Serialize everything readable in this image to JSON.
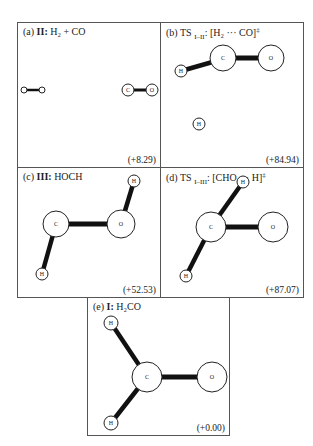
{
  "panels": [
    {
      "id": "a",
      "prefix": "(a) ",
      "label": "II:",
      "formula": "H₂ + CO",
      "energy": "(+8.29)"
    },
    {
      "id": "b",
      "prefix": "(b) TS ",
      "sub": "I–II",
      "formula": ": [H₂ ··· CO]",
      "sup": "‡",
      "energy": "(+84.94)"
    },
    {
      "id": "c",
      "prefix": "(c) ",
      "label": "III:",
      "formula": "HOCH",
      "energy": "(+52.53)"
    },
    {
      "id": "d",
      "prefix": "(d)  TS ",
      "sub": "I–III",
      "formula": ": [CHO ··· H]",
      "sup": "‡",
      "energy": "(+87.07)"
    },
    {
      "id": "e",
      "prefix": "(e) ",
      "label": "I:",
      "formula": "H₂CO",
      "energy": "(+0.00)"
    }
  ],
  "atoms": {
    "H": "H",
    "C": "C",
    "O": "O"
  }
}
